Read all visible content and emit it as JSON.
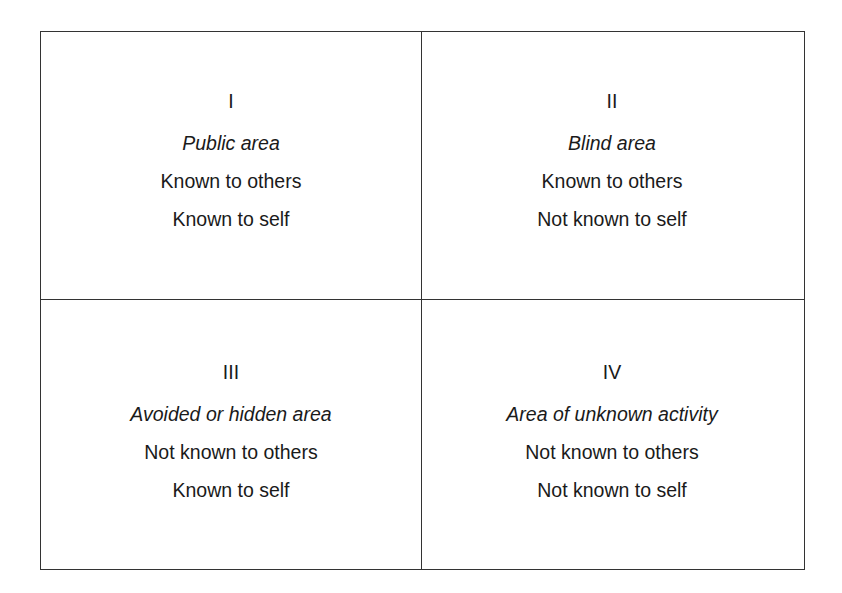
{
  "diagram": {
    "quadrants": [
      {
        "numeral": "I",
        "title": "Public area",
        "line1": "Known to others",
        "line2": "Known to self"
      },
      {
        "numeral": "II",
        "title": "Blind area",
        "line1": "Known to others",
        "line2": "Not known to self"
      },
      {
        "numeral": "III",
        "title": "Avoided or hidden area",
        "line1": "Not known to others",
        "line2": "Known to self"
      },
      {
        "numeral": "IV",
        "title": "Area of unknown activity",
        "line1": "Not known to others",
        "line2": "Not known to self"
      }
    ]
  }
}
